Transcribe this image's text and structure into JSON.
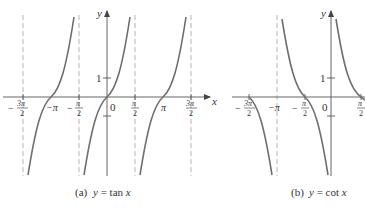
{
  "figure": {
    "panels": [
      {
        "id": "a",
        "caption": "(a)  y = tan x",
        "caption_prefix": "(a)",
        "caption_eq": "y = tan x",
        "function": "tan",
        "y_axis_label": "y",
        "x_axis_label": "x",
        "y_tick_label": "1",
        "origin_label": "0",
        "x_ticks": [
          {
            "label_num": "3π",
            "label_den": "2",
            "sign": "−",
            "value": "-3π/2"
          },
          {
            "label": "−π",
            "value": "-π"
          },
          {
            "label_num": "π",
            "label_den": "2",
            "sign": "−",
            "value": "-π/2"
          },
          {
            "label_num": "π",
            "label_den": "2",
            "sign": "",
            "value": "π/2"
          },
          {
            "label": "π",
            "value": "π"
          },
          {
            "label_num": "3π",
            "label_den": "2",
            "sign": "",
            "value": "3π/2"
          }
        ],
        "asymptotes": [
          "-3π/2",
          "-π/2",
          "π/2",
          "3π/2"
        ]
      },
      {
        "id": "b",
        "caption": "(b)  y = cot x",
        "caption_prefix": "(b)",
        "caption_eq": "y = cot x",
        "function": "cot",
        "y_axis_label": "y",
        "y_tick_label": "1",
        "origin_label": "0",
        "x_ticks": [
          {
            "label_num": "3π",
            "label_den": "2",
            "sign": "−",
            "value": "-3π/2"
          },
          {
            "label": "−π",
            "value": "-π"
          },
          {
            "label_num": "π",
            "label_den": "2",
            "sign": "−",
            "value": "-π/2"
          },
          {
            "label_num": "π",
            "label_den": "2",
            "sign": "",
            "value": "π/2"
          }
        ],
        "asymptotes": [
          "-π",
          "0"
        ]
      }
    ],
    "colors": {
      "curve": "#6e6e6e",
      "axis": "#555555",
      "asymptote": "#aaaaaa",
      "text": "#333333"
    }
  }
}
